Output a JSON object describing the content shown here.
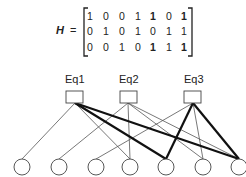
{
  "matrix": {
    "label": "H",
    "equals": "=",
    "rows": [
      [
        "1",
        "0",
        "0",
        "1",
        "1",
        "0",
        "1"
      ],
      [
        "0",
        "1",
        "0",
        "1",
        "0",
        "1",
        "1"
      ],
      [
        "0",
        "0",
        "1",
        "0",
        "1",
        "1",
        "1"
      ]
    ]
  },
  "check_nodes": [
    {
      "label": "Eq1"
    },
    {
      "label": "Eq2"
    },
    {
      "label": "Eq3"
    }
  ],
  "variable_nodes": 7
}
